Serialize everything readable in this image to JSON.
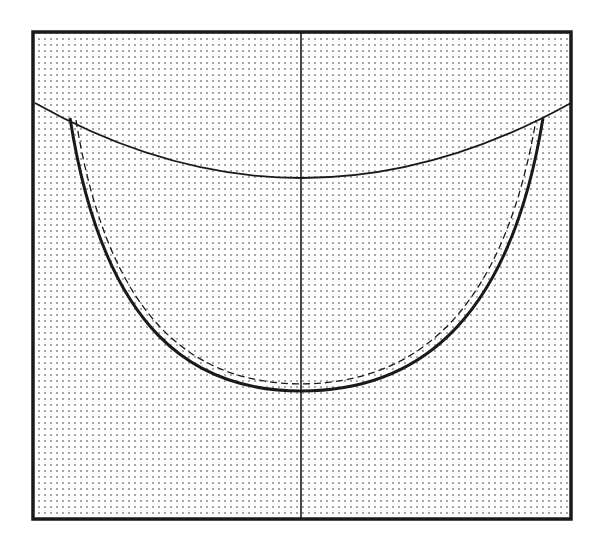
{
  "diagram": {
    "colors": {
      "background": "#ffffff",
      "ink": "#1a1a1a",
      "stipple": "#7a7a7a"
    },
    "elements": {
      "frame": "square-frame",
      "axis": "vertical-center-line",
      "upper_arc": "shallow-upper-curve",
      "bowl_solid": "deep-bowl-curve-solid",
      "bowl_dashed": "deep-bowl-curve-dashed",
      "fill": "stippled-dot-pattern"
    }
  }
}
